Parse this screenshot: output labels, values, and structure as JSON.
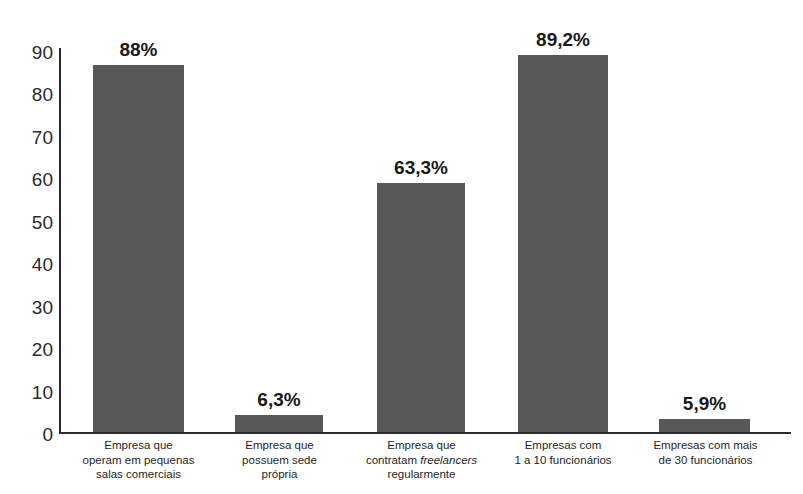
{
  "chart_data": {
    "type": "bar",
    "title": "",
    "subtitle": "",
    "xlabel": "",
    "ylabel": "",
    "ylim": [
      0,
      90
    ],
    "ytick_values": [
      0,
      10,
      20,
      30,
      40,
      50,
      60,
      70,
      80,
      90
    ],
    "ytick_labels": [
      "0",
      "10",
      "20",
      "30",
      "40",
      "50",
      "60",
      "70",
      "80",
      "90"
    ],
    "grid": false,
    "legend": null,
    "bar_color": "#585858",
    "axis_color": "#2b2b2b",
    "categories": [
      "Empresa que operam em pequenas salas comerciais",
      "Empresa que possuem sede própria",
      "Empresa que contratam freelancers regularmente",
      "Empresas com 1 a 10 funcionários",
      "Empresas com mais de 30 funcionários"
    ],
    "category_lines": [
      [
        "Empresa que",
        "operam em pequenas",
        "salas comerciais"
      ],
      [
        "Empresa que",
        "possuem sede",
        "própria"
      ],
      [
        "Empresa que",
        "contratam <em>freelancers</em>",
        "regularmente"
      ],
      [
        "Empresas com",
        "1 a 10 funcionários"
      ],
      [
        "Empresas com mais",
        "de 30 funcionários"
      ]
    ],
    "values": [
      87,
      4,
      59,
      89.2,
      3
    ],
    "data_labels": [
      "88%",
      "6,3%",
      "63,3%",
      "89,2%",
      "5,9%"
    ]
  }
}
